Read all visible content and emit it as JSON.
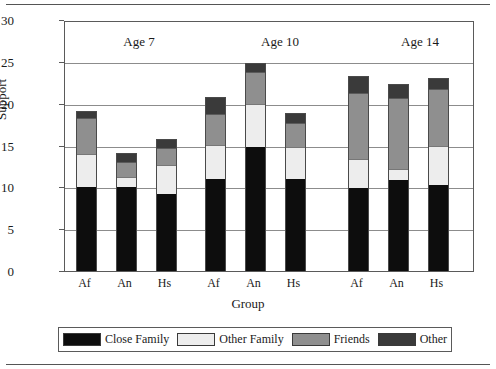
{
  "chart_data": {
    "type": "bar",
    "subtype": "stacked",
    "title": "",
    "xlabel": "Group",
    "ylabel": "Support",
    "ylim": [
      0,
      30
    ],
    "yticks": [
      0,
      5,
      10,
      15,
      20,
      25,
      30
    ],
    "grid": true,
    "legend_position": "bottom",
    "group_labels": [
      "Age 7",
      "Age 10",
      "Age 14"
    ],
    "categories": [
      "Af",
      "An",
      "Hs",
      "Af",
      "An",
      "Hs",
      "Af",
      "An",
      "Hs"
    ],
    "series": [
      {
        "name": "Close Family",
        "color": "#0d0d0d",
        "values": [
          10.0,
          10.0,
          9.2,
          11.0,
          14.8,
          11.0,
          9.9,
          10.9,
          10.3
        ]
      },
      {
        "name": "Other Family",
        "color": "#ededed",
        "values": [
          4.0,
          1.2,
          3.5,
          4.0,
          5.2,
          3.8,
          3.5,
          1.3,
          4.7
        ]
      },
      {
        "name": "Friends",
        "color": "#8f8f8f",
        "values": [
          4.3,
          1.8,
          2.0,
          3.8,
          3.8,
          2.9,
          7.9,
          8.5,
          6.8
        ]
      },
      {
        "name": "Other",
        "color": "#3a3a3a",
        "values": [
          0.7,
          1.0,
          1.0,
          1.9,
          1.0,
          1.1,
          1.9,
          1.5,
          1.2
        ]
      }
    ],
    "totals": [
      19.0,
      14.0,
      15.7,
      20.7,
      24.8,
      18.8,
      23.2,
      22.2,
      23.0
    ]
  },
  "axes": {
    "y_label": "Support",
    "x_label": "Group",
    "y_ticks": [
      "30",
      "25",
      "20",
      "15",
      "10",
      "5",
      "0"
    ]
  },
  "groups": [
    {
      "label": "Age 7"
    },
    {
      "label": "Age 10"
    },
    {
      "label": "Age 14"
    }
  ],
  "xticks": [
    "Af",
    "An",
    "Hs",
    "Af",
    "An",
    "Hs",
    "Af",
    "An",
    "Hs"
  ],
  "legend": {
    "items": [
      {
        "label": "Close Family",
        "swatch": "close"
      },
      {
        "label": "Other Family",
        "swatch": "otherf"
      },
      {
        "label": "Friends",
        "swatch": "friends"
      },
      {
        "label": "Other",
        "swatch": "other"
      }
    ]
  }
}
